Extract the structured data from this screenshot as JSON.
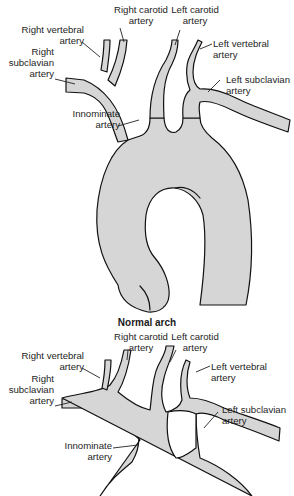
{
  "figure": {
    "panels": [
      {
        "id": "normal",
        "caption": "Normal arch",
        "labels": {
          "right_vertebral": [
            "Right vertebral",
            "artery"
          ],
          "right_subclavian": [
            "Right",
            "subclavian",
            "artery"
          ],
          "right_carotid": [
            "Right carotid",
            "artery"
          ],
          "left_carotid": [
            "Left carotid",
            "artery"
          ],
          "left_vertebral": [
            "Left vertebral",
            "artery"
          ],
          "left_subclavian": [
            "Left subclavian",
            "artery"
          ],
          "innominate": [
            "Innominate",
            "artery"
          ]
        }
      },
      {
        "id": "variant",
        "caption": "",
        "labels": {
          "right_vertebral": [
            "Right vertebral",
            "artery"
          ],
          "right_subclavian": [
            "Right",
            "subclavian",
            "artery"
          ],
          "right_carotid": [
            "Right carotid",
            "artery"
          ],
          "left_carotid": [
            "Left carotid",
            "artery"
          ],
          "left_vertebral": [
            "Left vertebral",
            "artery"
          ],
          "left_subclavian": [
            "Left subclavian",
            "artery"
          ],
          "innominate": [
            "Innominate",
            "artery"
          ]
        }
      }
    ],
    "colors": {
      "vessel_fill": "#d6d6d6",
      "outline": "#111111",
      "background": "#ffffff"
    }
  }
}
